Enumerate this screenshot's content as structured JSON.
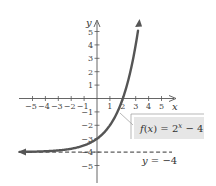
{
  "chart_data": {
    "type": "line",
    "title": "",
    "xlabel": "x",
    "ylabel": "y",
    "xlim": [
      -6,
      6
    ],
    "ylim": [
      -6,
      6
    ],
    "x_ticks": [
      -5,
      -4,
      -3,
      -2,
      -1,
      1,
      2,
      3,
      4,
      5
    ],
    "y_ticks": [
      -5,
      -4,
      -3,
      -2,
      -1,
      1,
      2,
      3,
      4,
      5
    ],
    "x_tick_labels": [
      "−5",
      "−4",
      "−3",
      "−2",
      "−1",
      "1",
      "2",
      "3",
      "4",
      "5"
    ],
    "y_tick_labels": [
      "−5",
      "−4",
      "−3",
      "−2",
      "−1",
      "1",
      "2",
      "3",
      "4",
      "5"
    ],
    "grid": false,
    "series": [
      {
        "name": "f(x) = 2^x − 4",
        "expression": "2^x - 4",
        "style": "solid-thick",
        "color": "#555555",
        "x": [
          -6,
          -5,
          -4,
          -3,
          -2,
          -1,
          0,
          1,
          2,
          3,
          3.26
        ],
        "values": [
          -3.98,
          -3.97,
          -3.94,
          -3.88,
          -3.75,
          -3.5,
          -3,
          -2,
          0,
          4,
          5.6
        ],
        "arrows": "both"
      },
      {
        "name": "y = −4",
        "expression": "-4",
        "style": "dashed",
        "color": "#333333",
        "x": [
          -6,
          5.8
        ],
        "values": [
          -4,
          -4
        ]
      }
    ],
    "annotations": [
      {
        "text_parts": [
          "f",
          "(",
          "x",
          ") = 2",
          "x",
          " − 4"
        ],
        "label": "f(x) = 2^x − 4",
        "boxed": true,
        "box_color": "#e6e6e6",
        "points_to": [
          1.7,
          -1
        ]
      },
      {
        "label": "y = −4",
        "position": [
          3.5,
          -5
        ]
      }
    ]
  },
  "colors": {
    "axis": "#555555",
    "curve": "#555555",
    "label_box": "#e6e6e6",
    "label_border": "#999999"
  }
}
